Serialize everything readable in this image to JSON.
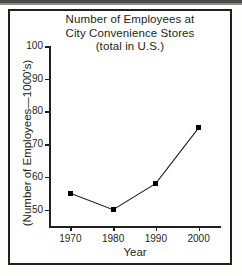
{
  "figure": {
    "frame_color": "#231f20",
    "background": "#ffffff"
  },
  "chart_data": {
    "type": "line",
    "title": "Number of Employees at City Convenience Stores (total in U.S.)",
    "title_lines": [
      "Number of Employees at",
      "City Convenience Stores",
      "(total in U.S.)"
    ],
    "xlabel": "Year",
    "ylabel": "(Number of Employees—1000's)",
    "categories": [
      "1970",
      "1980",
      "1990",
      "2000"
    ],
    "x": [
      1970,
      1980,
      1990,
      2000
    ],
    "values": [
      55,
      50,
      58,
      75
    ],
    "series": [
      {
        "name": "Number of Employees",
        "values": [
          55,
          50,
          58,
          75
        ],
        "marker": "filled-square",
        "marker_color": "#000000",
        "line_color": "#231f20"
      }
    ],
    "ylim": [
      45,
      100
    ],
    "xlim": [
      1965,
      2005
    ],
    "yticks": [
      50,
      60,
      70,
      80,
      90,
      100
    ],
    "ytick_labels": [
      "50",
      "60",
      "70",
      "80",
      "90",
      "100"
    ],
    "xticks": [
      1970,
      1980,
      1990,
      2000
    ],
    "xtick_labels": [
      "1970",
      "1980",
      "1990",
      "2000"
    ],
    "grid": false,
    "legend": false,
    "legend_position": "none"
  }
}
